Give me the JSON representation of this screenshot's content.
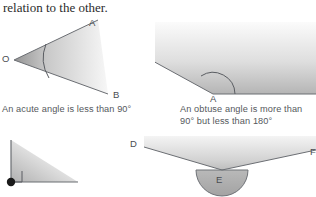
{
  "page": {
    "intro_text": "relation to the other.",
    "background_color": "#ffffff",
    "text_color": "#2b2b2b",
    "caption_color": "#55585c",
    "stroke_color": "#6b6e73",
    "fill_light": "#f2f2f2",
    "fill_dark": "#9a9a9a"
  },
  "figures": {
    "acute": {
      "name": "acute-angle-figure",
      "caption": "An acute angle is less than 90°",
      "vertex_label": "O",
      "ray_labels": [
        "A",
        "B"
      ],
      "angle_description": "less than 90 degrees"
    },
    "obtuse": {
      "name": "obtuse-angle-figure",
      "caption_line1": "An obtuse angle is more than",
      "caption_line2": "90° but less than 180°",
      "vertex_label": "A",
      "angle_description": "more than 90 but less than 180 degrees"
    },
    "right": {
      "name": "right-angle-figure",
      "caption": "",
      "vertex_label": "",
      "angle_description": "exactly 90 degrees, square marker at vertex"
    },
    "reflex": {
      "name": "reflex-angle-figure",
      "caption": "",
      "vertex_label": "E",
      "ray_labels": [
        "D",
        "F"
      ],
      "angle_description": "reflex angle greater than 180 degrees"
    }
  }
}
